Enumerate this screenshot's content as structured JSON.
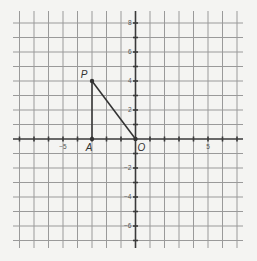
{
  "diagram": {
    "type": "coordinate-grid",
    "x_range": [
      -8,
      7
    ],
    "y_range": [
      -7,
      8
    ],
    "x_tick_labels": [
      {
        "value": -5,
        "text": "−5"
      },
      {
        "value": 5,
        "text": "5"
      }
    ],
    "y_tick_labels": [
      {
        "value": 8,
        "text": "8"
      },
      {
        "value": 6,
        "text": "6"
      },
      {
        "value": 4,
        "text": "4"
      },
      {
        "value": 2,
        "text": "2"
      },
      {
        "value": -2,
        "text": "−2"
      },
      {
        "value": -4,
        "text": "−4"
      },
      {
        "value": -6,
        "text": "−6"
      }
    ],
    "points": [
      {
        "name": "P",
        "x": -3,
        "y": 4
      },
      {
        "name": "A",
        "x": -3,
        "y": 0
      },
      {
        "name": "O",
        "x": 0,
        "y": 0
      }
    ],
    "segments": [
      [
        "P",
        "A"
      ],
      [
        "P",
        "O"
      ]
    ],
    "colors": {
      "grid": "#9a9a9a",
      "axis": "#3a3a3a",
      "ink": "#333333",
      "background": "#f4f4f2"
    }
  }
}
